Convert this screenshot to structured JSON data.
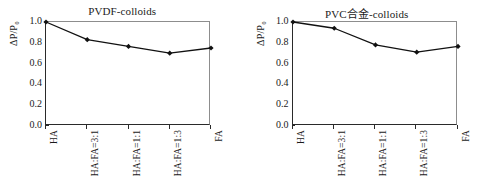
{
  "figure": {
    "background": "#ffffff",
    "line_color": "#111111",
    "marker_color": "#111111",
    "axis_color": "#2a2a2a",
    "frame_color": "#8d8d8d"
  },
  "chart_data": [
    {
      "type": "line",
      "title": "PVDF-colloids",
      "xlabel": "",
      "ylabel": "ΔP/P₀",
      "categories": [
        "HA",
        "HA:FA=3:1",
        "HA:FA=1:1",
        "HA:FA=1:3",
        "FA"
      ],
      "values": [
        1.0,
        0.83,
        0.765,
        0.7,
        0.75
      ],
      "ylim": [
        0.0,
        1.0
      ],
      "yticks": [
        0.0,
        0.2,
        0.4,
        0.6,
        0.8,
        1.0
      ],
      "yticklabels": [
        "0.0",
        "0.2",
        "0.4",
        "0.6",
        "0.8",
        "1.0"
      ],
      "grid": false,
      "legend": false,
      "marker": "diamond"
    },
    {
      "type": "line",
      "title": "PVC合金-colloids",
      "xlabel": "",
      "ylabel": "ΔP/P₀",
      "categories": [
        "HA",
        "HA:FA=3:1",
        "HA:FA=1:1",
        "HA:FA=1:3",
        "FA"
      ],
      "values": [
        1.0,
        0.94,
        0.78,
        0.71,
        0.765
      ],
      "ylim": [
        0.0,
        1.0
      ],
      "yticks": [
        0.0,
        0.2,
        0.4,
        0.6,
        0.8,
        1.0
      ],
      "yticklabels": [
        "0.0",
        "0.2",
        "0.4",
        "0.6",
        "0.8",
        "1.0"
      ],
      "grid": false,
      "legend": false,
      "marker": "diamond"
    }
  ]
}
